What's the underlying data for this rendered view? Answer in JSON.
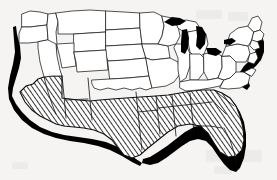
{
  "figure": {
    "name": "united-states-map",
    "title": "Map of the United States with Sun Belt states shaded",
    "medium": "scanned line drawing",
    "background_color": "#f5f4f2",
    "ink_color": "#101010",
    "shadow_color": "#000000",
    "hatch": {
      "style": "diagonal-line-hatch",
      "direction": "lower-left-to-upper-right",
      "angle_degrees": 35,
      "spacing_px": 1.6,
      "stroke_color": "#111111",
      "stroke_width_px": 0.8
    },
    "border": {
      "state_line_color": "#1a1a1a",
      "state_line_width_px": 0.7,
      "outline_width_px": 1.1
    }
  },
  "legend_implied": {
    "shaded_meaning": "Sun Belt / highlighted southern states",
    "unshaded_meaning": "remaining states"
  },
  "regions": {
    "shaded_states": [
      "California",
      "Arizona",
      "New Mexico",
      "Texas",
      "Louisiana",
      "Arkansas",
      "Mississippi",
      "Alabama",
      "Tennessee",
      "Georgia",
      "Florida",
      "South Carolina",
      "North Carolina"
    ],
    "unshaded_states": [
      "Washington",
      "Oregon",
      "Idaho",
      "Nevada",
      "Utah",
      "Montana",
      "Wyoming",
      "Colorado",
      "North Dakota",
      "South Dakota",
      "Nebraska",
      "Kansas",
      "Oklahoma",
      "Minnesota",
      "Iowa",
      "Missouri",
      "Wisconsin",
      "Illinois",
      "Michigan",
      "Indiana",
      "Ohio",
      "Kentucky",
      "West Virginia",
      "Virginia",
      "Pennsylvania",
      "New York",
      "Maryland",
      "Delaware",
      "New Jersey",
      "Connecticut",
      "Rhode Island",
      "Massachusetts",
      "Vermont",
      "New Hampshire",
      "Maine"
    ],
    "water_bodies": [
      "Lake Superior",
      "Lake Michigan",
      "Lake Huron",
      "Lake Erie",
      "Lake Ontario"
    ]
  },
  "shadow_edges": [
    "Pacific coast",
    "Gulf of Mexico coast",
    "Florida peninsula",
    "Atlantic southeast coast",
    "New England coast"
  ]
}
